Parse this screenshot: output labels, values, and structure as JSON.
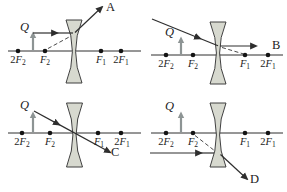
{
  "figure_type": "diverging-lens ray diagrams (4 panels)",
  "colors": {
    "axis": "#2e2e2e",
    "ray": "#2e2e2e",
    "dashed": "#4a4a4a",
    "lens_fill": "#d7d9cf",
    "lens_stroke": "#3f3f3f",
    "object_arrow": "#8d9494",
    "dot": "#141414",
    "background": "#ffffff"
  },
  "panels": [
    {
      "name": "top-left",
      "object_label": "Q",
      "answer_label": "A",
      "points": [
        {
          "pre": "2",
          "letter": "F",
          "sub": "2"
        },
        {
          "pre": "",
          "letter": "F",
          "sub": "2"
        },
        {
          "pre": "",
          "letter": "F",
          "sub": "1"
        },
        {
          "pre": "2",
          "letter": "F",
          "sub": "1"
        }
      ]
    },
    {
      "name": "top-right",
      "object_label": "Q",
      "answer_label": "B",
      "points": [
        {
          "pre": "2",
          "letter": "F",
          "sub": "2"
        },
        {
          "pre": "",
          "letter": "F",
          "sub": "2"
        },
        {
          "pre": "",
          "letter": "F",
          "sub": "1"
        },
        {
          "pre": "2",
          "letter": "F",
          "sub": "1"
        }
      ]
    },
    {
      "name": "bottom-left",
      "object_label": "Q",
      "answer_label": "C",
      "points": [
        {
          "pre": "2",
          "letter": "F",
          "sub": "2"
        },
        {
          "pre": "",
          "letter": "F",
          "sub": "2"
        },
        {
          "pre": "",
          "letter": "F",
          "sub": "1"
        },
        {
          "pre": "2",
          "letter": "F",
          "sub": "1"
        }
      ]
    },
    {
      "name": "bottom-right",
      "object_label": "Q",
      "answer_label": "D",
      "points": [
        {
          "pre": "2",
          "letter": "F",
          "sub": "2"
        },
        {
          "pre": "",
          "letter": "F",
          "sub": "2"
        },
        {
          "pre": "",
          "letter": "F",
          "sub": "1"
        },
        {
          "pre": "2",
          "letter": "F",
          "sub": "1"
        }
      ]
    }
  ]
}
